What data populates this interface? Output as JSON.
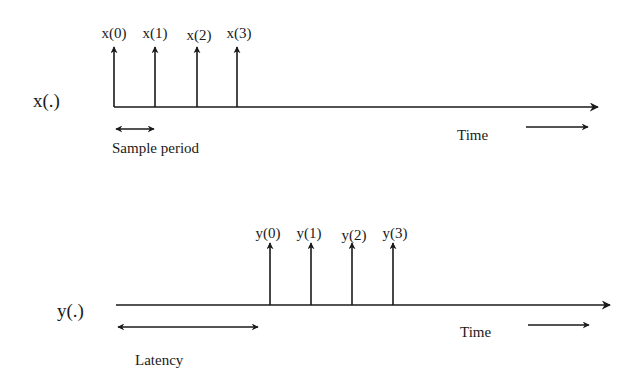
{
  "diagram": {
    "type": "timing-diagram",
    "colors": {
      "ink": "#1a1a1a",
      "background": "#ffffff"
    },
    "input_signal": {
      "label": "x(.)",
      "samples": [
        "x(0)",
        "x(1)",
        "x(2)",
        "x(3)"
      ],
      "period_label": "Sample period",
      "time_label": "Time"
    },
    "output_signal": {
      "label": "y(.)",
      "samples": [
        "y(0)",
        "y(1)",
        "y(2)",
        "y(3)"
      ],
      "latency_label": "Latency",
      "time_label": "Time"
    }
  }
}
